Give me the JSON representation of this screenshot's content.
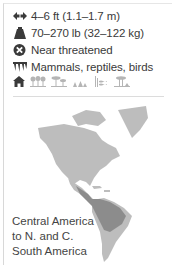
{
  "facts": [
    {
      "icon": "length-icon",
      "text": "4–6 ft (1.1–1.7 m)"
    },
    {
      "icon": "weight-icon",
      "text": "70–270 lb (32–122 kg)"
    },
    {
      "icon": "status-icon",
      "text": "Near threatened"
    },
    {
      "icon": "diet-icon",
      "text": "Mammals, reptiles, birds"
    }
  ],
  "habitats": [
    "rainforest",
    "tropical forest",
    "grassland",
    "wetland",
    "scrub"
  ],
  "region": {
    "lines": [
      "Central America",
      "to N. and C.",
      "South America"
    ]
  },
  "colors": {
    "icon": "#3a3a3a",
    "habitat_icon": "#b5b5b5",
    "map_land": "#bdbdbd",
    "map_range": "#8c8c8c"
  }
}
